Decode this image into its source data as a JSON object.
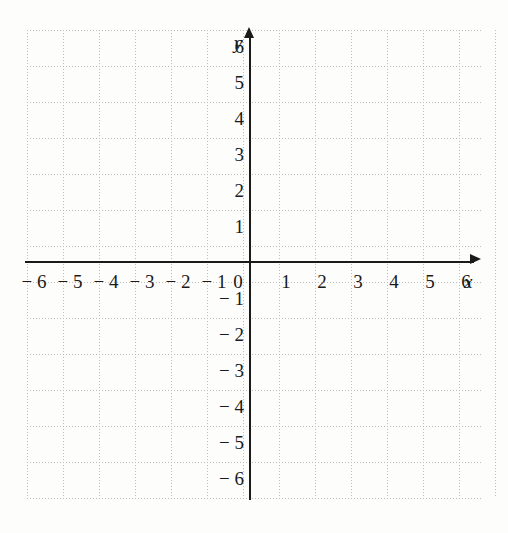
{
  "chart_data": {
    "type": "scatter",
    "title": "",
    "subtitle": "",
    "xlabel": "x",
    "ylabel": "y",
    "xlim": [
      -6.5,
      6.5
    ],
    "ylim": [
      -6.5,
      6.5
    ],
    "grid": true,
    "legend": null,
    "series": [],
    "x_ticks": [
      "− 6",
      "− 5",
      "− 4",
      "− 3",
      "− 2",
      "− 1",
      "0",
      "1",
      "2",
      "3",
      "4",
      "5",
      "6"
    ],
    "x_tick_values": [
      -6,
      -5,
      -4,
      -3,
      -2,
      -1,
      0,
      1,
      2,
      3,
      4,
      5,
      6
    ],
    "y_ticks": [
      "6",
      "5",
      "4",
      "3",
      "2",
      "1",
      "− 1",
      "− 2",
      "− 3",
      "− 4",
      "− 5",
      "− 6"
    ],
    "y_tick_values": [
      6,
      5,
      4,
      3,
      2,
      1,
      -1,
      -2,
      -3,
      -4,
      -5,
      -6
    ],
    "origin_label": "0",
    "annotations": [],
    "colors": {
      "axis": "#1a1a1a",
      "grid": "#bdbdbd",
      "background": "#fdfdfc",
      "text": "#1a1a1a"
    }
  },
  "axes": {
    "x_name": "x",
    "y_name": "y"
  }
}
